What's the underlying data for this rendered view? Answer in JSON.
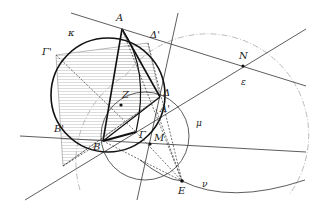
{
  "diagram": {
    "type": "geometric-construction",
    "circles": [
      {
        "name": "κ",
        "label": "κ",
        "center": [
          108,
          95
        ],
        "r": 57,
        "style": "thick solid"
      },
      {
        "name": "μ",
        "label": "μ",
        "center": [
          145,
          136
        ],
        "r": 44,
        "style": "thin solid"
      },
      {
        "name": "ε",
        "label": "ε",
        "center": [
          180,
          170
        ],
        "r": 100,
        "style": "dash-dot gray arc"
      }
    ],
    "curves": [
      {
        "name": "ν",
        "label": "ν",
        "style": "thin solid curve through E"
      }
    ],
    "points": {
      "A": {
        "label": "A",
        "xy": [
          122,
          29
        ]
      },
      "Dp": {
        "label": "Δ'",
        "xy": [
          148,
          43
        ]
      },
      "Gp": {
        "label": "Γ'",
        "xy": [
          56,
          55
        ]
      },
      "Z": {
        "label": "Z",
        "xy": [
          121,
          102
        ]
      },
      "D": {
        "label": "Δ",
        "xy": [
          160,
          97
        ]
      },
      "Ap": {
        "label": "A'",
        "xy": [
          156,
          109
        ]
      },
      "Bp": {
        "label": "B'",
        "xy": [
          63,
          166
        ]
      },
      "B": {
        "label": "B",
        "xy": [
          103,
          141
        ]
      },
      "G": {
        "label": "Γ",
        "xy": [
          136,
          132
        ]
      },
      "M": {
        "label": "M",
        "xy": [
          150,
          144
        ]
      },
      "E": {
        "label": "E",
        "xy": [
          182,
          181
        ]
      },
      "N": {
        "label": "N",
        "xy": [
          243,
          66
        ]
      }
    },
    "labels": {
      "A": "A",
      "Dp": "Δ'",
      "Gp": "Γ'",
      "kappa": "κ",
      "Z": "Z",
      "D": "Δ",
      "Ap": "A'",
      "Bp": "B'",
      "B": "B",
      "G": "Γ",
      "M": "M",
      "E": "E",
      "N": "N",
      "epsilon": "ε",
      "mu": "μ",
      "nu": "ν"
    },
    "colors": {
      "stroke": "#222222",
      "gray_line": "#999999",
      "hatch": "#bbbbbb",
      "background": "#ffffff"
    }
  }
}
